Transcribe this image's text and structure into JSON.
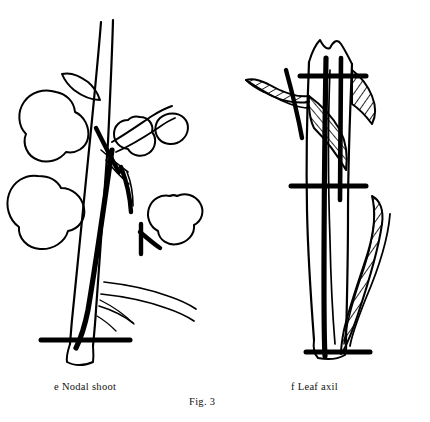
{
  "figure": {
    "number": "Fig. 3",
    "panels": [
      {
        "id": "e",
        "letter": "e",
        "label": "Nodal shoot",
        "caption": "e  Nodal shoot"
      },
      {
        "id": "f",
        "letter": "f",
        "label": "Leaf axil",
        "caption": "f  Leaf axil"
      }
    ],
    "caption_full": "Fig. 3",
    "ink_color": "#000000",
    "background_color": "#ffffff"
  }
}
